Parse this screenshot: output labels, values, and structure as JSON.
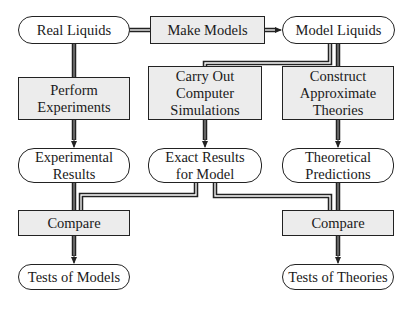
{
  "diagram": {
    "nodes": {
      "real_liquids": {
        "label": "Real Liquids",
        "shape": "rounded"
      },
      "make_models": {
        "label": "Make Models",
        "shape": "rect"
      },
      "model_liquids": {
        "label": "Model Liquids",
        "shape": "rounded"
      },
      "perform_experiments": {
        "label": "Perform\nExperiments",
        "shape": "rect"
      },
      "computer_simulations": {
        "label": "Carry Out\nComputer\nSimulations",
        "shape": "rect"
      },
      "approximate_theories": {
        "label": "Construct\nApproximate\nTheories",
        "shape": "rect"
      },
      "experimental_results": {
        "label": "Experimental\nResults",
        "shape": "rounded"
      },
      "exact_results": {
        "label": "Exact Results\nfor Model",
        "shape": "rounded"
      },
      "theoretical_predictions": {
        "label": "Theoretical\nPredictions",
        "shape": "rounded"
      },
      "compare_left": {
        "label": "Compare",
        "shape": "rect"
      },
      "compare_right": {
        "label": "Compare",
        "shape": "rect"
      },
      "tests_of_models": {
        "label": "Tests of Models",
        "shape": "rounded"
      },
      "tests_of_theories": {
        "label": "Tests of Theories",
        "shape": "rounded"
      }
    },
    "edges": [
      {
        "from": "Real Liquids",
        "to": "Make Models"
      },
      {
        "from": "Make Models",
        "to": "Model Liquids"
      },
      {
        "from": "Real Liquids",
        "to": "Perform Experiments"
      },
      {
        "from": "Model Liquids",
        "to": "Carry Out Computer Simulations"
      },
      {
        "from": "Model Liquids",
        "to": "Construct Approximate Theories"
      },
      {
        "from": "Perform Experiments",
        "to": "Experimental Results"
      },
      {
        "from": "Carry Out Computer Simulations",
        "to": "Exact Results for Model"
      },
      {
        "from": "Construct Approximate Theories",
        "to": "Theoretical Predictions"
      },
      {
        "from": "Experimental Results",
        "to": "Compare (left)"
      },
      {
        "from": "Exact Results for Model",
        "to": "Compare (left)"
      },
      {
        "from": "Exact Results for Model",
        "to": "Compare (right)"
      },
      {
        "from": "Theoretical Predictions",
        "to": "Compare (right)"
      },
      {
        "from": "Compare (left)",
        "to": "Tests of Models"
      },
      {
        "from": "Compare (right)",
        "to": "Tests of Theories"
      }
    ],
    "colors": {
      "rect_fill": "#ececec",
      "rounded_fill": "#ffffff",
      "stroke": "#222222",
      "connector_inner": "#ffffff"
    }
  }
}
